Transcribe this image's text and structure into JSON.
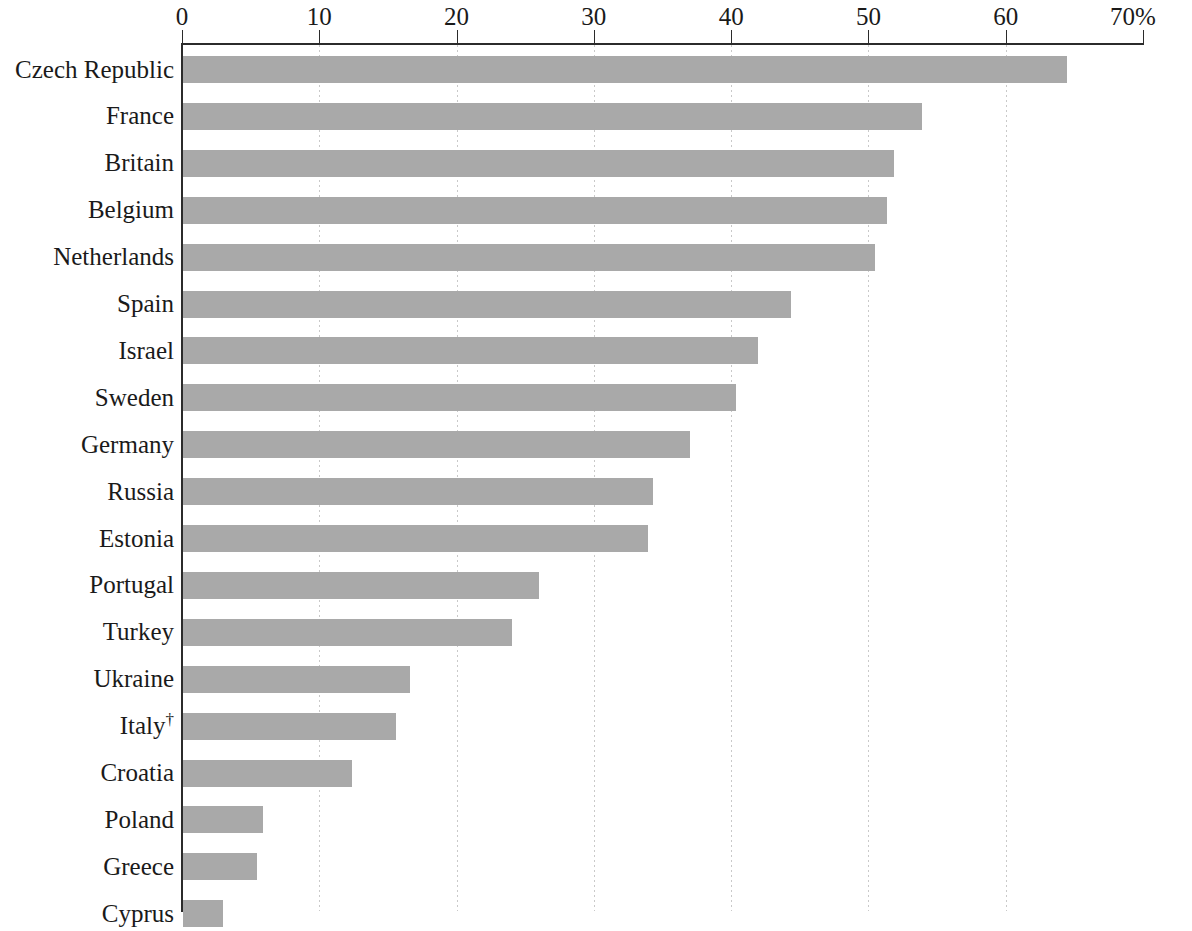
{
  "chart_data": {
    "type": "bar",
    "orientation": "horizontal",
    "title": "",
    "subtitle": "",
    "xlabel": "",
    "ylabel": "",
    "xlim": [
      0,
      70
    ],
    "xtick_values": [
      0,
      10,
      20,
      30,
      40,
      50,
      60,
      70
    ],
    "xtick_labels": [
      "0",
      "10",
      "20",
      "30",
      "40",
      "50",
      "60",
      "70%"
    ],
    "unit": "%",
    "grid": "vertical-dotted",
    "legend": "none",
    "bar_color": "#a9a9a9",
    "axis_color": "#2b2b2b",
    "gridline_color": "#c9c9c9",
    "categories": [
      "Czech Republic",
      "France",
      "Britain",
      "Belgium",
      "Netherlands",
      "Spain",
      "Israel",
      "Sweden",
      "Germany",
      "Russia",
      "Estonia",
      "Portugal",
      "Turkey",
      "Ukraine",
      "Italy†",
      "Croatia",
      "Poland",
      "Greece",
      "Cyprus"
    ],
    "values": [
      64.4,
      53.8,
      51.8,
      51.3,
      50.4,
      44.3,
      41.9,
      40.3,
      36.9,
      34.2,
      33.9,
      25.9,
      24.0,
      16.5,
      15.5,
      12.3,
      5.8,
      5.4,
      2.9
    ],
    "annotations": [
      "†"
    ]
  },
  "axis": {
    "ticks": [
      {
        "label": "0",
        "value": 0
      },
      {
        "label": "10",
        "value": 10
      },
      {
        "label": "20",
        "value": 20
      },
      {
        "label": "30",
        "value": 30
      },
      {
        "label": "40",
        "value": 40
      },
      {
        "label": "50",
        "value": 50
      },
      {
        "label": "60",
        "value": 60
      },
      {
        "label": "70%",
        "value": 70
      }
    ]
  },
  "rows": [
    {
      "label": "Czech Republic",
      "value": 64.4,
      "dagger": false
    },
    {
      "label": "France",
      "value": 53.8,
      "dagger": false
    },
    {
      "label": "Britain",
      "value": 51.8,
      "dagger": false
    },
    {
      "label": "Belgium",
      "value": 51.3,
      "dagger": false
    },
    {
      "label": "Netherlands",
      "value": 50.4,
      "dagger": false
    },
    {
      "label": "Spain",
      "value": 44.3,
      "dagger": false
    },
    {
      "label": "Israel",
      "value": 41.9,
      "dagger": false
    },
    {
      "label": "Sweden",
      "value": 40.3,
      "dagger": false
    },
    {
      "label": "Germany",
      "value": 36.9,
      "dagger": false
    },
    {
      "label": "Russia",
      "value": 34.2,
      "dagger": false
    },
    {
      "label": "Estonia",
      "value": 33.9,
      "dagger": false
    },
    {
      "label": "Portugal",
      "value": 25.9,
      "dagger": false
    },
    {
      "label": "Turkey",
      "value": 24.0,
      "dagger": false
    },
    {
      "label": "Ukraine",
      "value": 16.5,
      "dagger": false
    },
    {
      "label": "Italy",
      "value": 15.5,
      "dagger": true
    },
    {
      "label": "Croatia",
      "value": 12.3,
      "dagger": false
    },
    {
      "label": "Poland",
      "value": 5.8,
      "dagger": false
    },
    {
      "label": "Greece",
      "value": 5.4,
      "dagger": false
    },
    {
      "label": "Cyprus",
      "value": 2.9,
      "dagger": false
    }
  ]
}
